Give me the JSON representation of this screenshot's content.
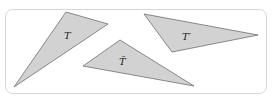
{
  "figure": {
    "width": 273,
    "height": 106,
    "frame": {
      "x": 5.5,
      "y": 9.5,
      "width": 261,
      "height": 84,
      "rx": 7,
      "stroke": "#d6d6d6"
    },
    "fill_color": "#d2d2d2",
    "stroke_color": "#6e6e6e",
    "triangles": [
      {
        "id": "T",
        "label": "T",
        "points": "66,12 108,24 14,87",
        "label_x": 64,
        "label_y": 39
      },
      {
        "id": "T-tilde",
        "label": "T̃",
        "points": "83,66 120,40 194,86",
        "label_x": 119,
        "label_y": 65
      },
      {
        "id": "T-prime",
        "label": "T′",
        "points": "144,14 258,35 172,52",
        "label_x": 182,
        "label_y": 40
      }
    ]
  }
}
